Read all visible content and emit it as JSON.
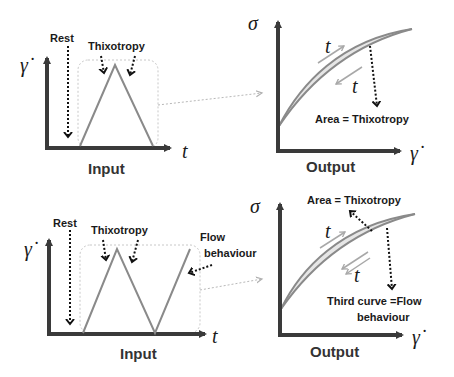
{
  "panels": {
    "top_input": {
      "title": "Input",
      "y_axis_symbol": "γ̇",
      "x_axis_symbol": "t",
      "annotations": {
        "rest": "Rest",
        "thixotropy": "Thixotropy"
      }
    },
    "top_output": {
      "title": "Output",
      "y_axis_symbol": "σ",
      "x_axis_symbol": "γ̇",
      "curve_labels": {
        "up": "t",
        "down": "t"
      },
      "annotations": {
        "area": "Area = Thixotropy"
      }
    },
    "bottom_input": {
      "title": "Input",
      "y_axis_symbol": "γ̇",
      "x_axis_symbol": "t",
      "annotations": {
        "rest": "Rest",
        "thixotropy": "Thixotropy",
        "flow_line1": "Flow",
        "flow_line2": "behaviour"
      }
    },
    "bottom_output": {
      "title": "Output",
      "y_axis_symbol": "σ",
      "x_axis_symbol": "γ̇",
      "curve_labels": {
        "up": "t",
        "down": "t"
      },
      "annotations": {
        "area": "Area = Thixotropy",
        "third_line1": "Third curve =Flow",
        "third_line2": "behaviour"
      }
    }
  },
  "colors": {
    "axis": "#3a3a3a",
    "curve": "#8a8a8a",
    "area_fill": "#e6e6e6",
    "dashed_box": "#c8c8c8",
    "small_arrow": "#a8a8a8"
  }
}
